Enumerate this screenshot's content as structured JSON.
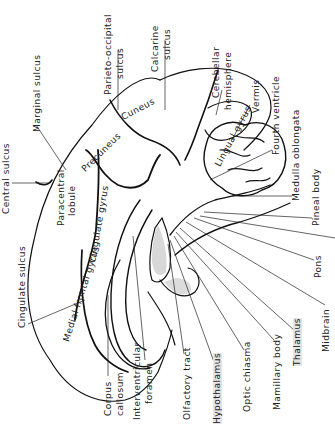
{
  "diagram": {
    "orientation": "rotated 90 degrees counter-clockwise",
    "highlight_color": "#e0e0e0",
    "line_color": "#111111",
    "external_labels": {
      "central_sulcus": "Central sulcus",
      "marginal_sulcus": "Marginal sulcus",
      "parieto_occipital_sulcus_1": "Parieto-occipital",
      "parieto_occipital_sulcus_2": "sulcus",
      "calcarine_sulcus_1": "Calcarine",
      "calcarine_sulcus_2": "sulcus",
      "cerebellar_hemisphere_1": "Cerebellar",
      "cerebellar_hemisphere_2": "hemisphere",
      "vermis": "Vermis",
      "fourth_ventricle": "Fourth ventricle",
      "medulla_oblongata": "Medulla oblongata",
      "pineal_body": "Pineal body",
      "pons": "Pons",
      "midbrain": "Midbrain",
      "thalamus": "Thalamus",
      "mamillary_body": "Mamillary body",
      "optic_chiasma": "Optic chiasma",
      "hypothalamus": "Hypothalamus",
      "olfactory_tract": "Olfactory tract",
      "interventricular_foramen_1": "Interventricular",
      "interventricular_foramen_2": "foramen",
      "corpus_callosum_1": "Corpus",
      "corpus_callosum_2": "callosum",
      "cingulate_sulcus": "Cingulate sulcus"
    },
    "internal_labels": {
      "cuneus": "Cuneus",
      "lingual_gyrus": "Lingual gyrus",
      "precuneus": "Precuneus",
      "paracentral_lobule_1": "Paracentral",
      "paracentral_lobule_2": "lobule",
      "cingulate_gyrus": "Cingulate gyrus",
      "medial_frontal_gyrus": "Medial frontal gyrus"
    },
    "highlighted_structures": [
      "Thalamus",
      "Hypothalamus"
    ]
  }
}
